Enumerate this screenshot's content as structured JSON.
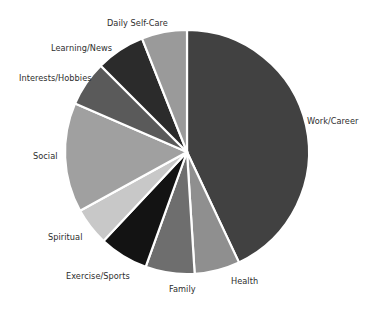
{
  "chart_data": {
    "type": "pie",
    "title": "",
    "subtitle": "",
    "xlabel": "",
    "ylabel": "",
    "legend_position": "none",
    "labels_position": "outside",
    "grid": false,
    "start_angle_deg": 90,
    "direction": "clockwise",
    "categories": [
      "Work/Career",
      "Health",
      "Family",
      "Exercise/Sports",
      "Spiritual",
      "Social",
      "Interests/Hobbies",
      "Learning/News",
      "Daily Self-Care"
    ],
    "values": [
      43.0,
      6.0,
      6.5,
      6.5,
      5.0,
      14.5,
      6.0,
      6.5,
      6.0
    ],
    "units": "percent",
    "colors": [
      "#414141",
      "#8f8f8f",
      "#6e6e6e",
      "#131313",
      "#c8c8c8",
      "#a0a0a0",
      "#5a5a5a",
      "#2b2b2b",
      "#9a9a9a"
    ],
    "slices": [
      {
        "label": "Work/Career",
        "value": 43.0,
        "color": "#414141",
        "start_deg": 0.0,
        "end_deg": 154.8
      },
      {
        "label": "Health",
        "value": 6.0,
        "color": "#8f8f8f",
        "start_deg": 154.8,
        "end_deg": 176.4
      },
      {
        "label": "Family",
        "value": 6.5,
        "color": "#6e6e6e",
        "start_deg": 176.4,
        "end_deg": 199.8
      },
      {
        "label": "Exercise/Sports",
        "value": 6.5,
        "color": "#131313",
        "start_deg": 199.8,
        "end_deg": 223.2
      },
      {
        "label": "Spiritual",
        "value": 5.0,
        "color": "#c8c8c8",
        "start_deg": 223.2,
        "end_deg": 241.2
      },
      {
        "label": "Social",
        "value": 14.5,
        "color": "#a0a0a0",
        "start_deg": 241.2,
        "end_deg": 293.4
      },
      {
        "label": "Interests/Hobbies",
        "value": 6.0,
        "color": "#5a5a5a",
        "start_deg": 293.4,
        "end_deg": 315.0
      },
      {
        "label": "Learning/News",
        "value": 6.5,
        "color": "#2b2b2b",
        "start_deg": 315.0,
        "end_deg": 338.4
      },
      {
        "label": "Daily Self-Care",
        "value": 6.0,
        "color": "#9a9a9a",
        "start_deg": 338.4,
        "end_deg": 360.0
      }
    ],
    "geometry": {
      "center_x": 187,
      "center_y": 152,
      "radius": 122,
      "slice_border_color": "#ffffff",
      "slice_border_width": 2.2,
      "background": "#ffffff"
    }
  },
  "labels": [
    {
      "text": "Work/Career",
      "x": 307,
      "y": 117,
      "anchor": "start"
    },
    {
      "text": "Health",
      "x": 231,
      "y": 277,
      "anchor": "start"
    },
    {
      "text": "Family",
      "x": 169,
      "y": 285,
      "anchor": "start"
    },
    {
      "text": "Exercise/Sports",
      "x": 66,
      "y": 272,
      "anchor": "start"
    },
    {
      "text": "Spiritual",
      "x": 48,
      "y": 233,
      "anchor": "start"
    },
    {
      "text": "Social",
      "x": 33,
      "y": 152,
      "anchor": "start"
    },
    {
      "text": "Interests/Hobbies",
      "x": 19,
      "y": 74,
      "anchor": "start"
    },
    {
      "text": "Learning/News",
      "x": 51,
      "y": 44,
      "anchor": "start"
    },
    {
      "text": "Daily Self-Care",
      "x": 107,
      "y": 19,
      "anchor": "start"
    }
  ]
}
